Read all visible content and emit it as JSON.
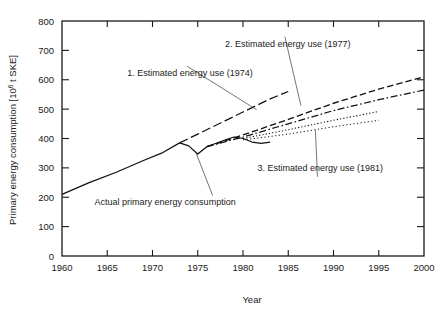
{
  "figure": {
    "kind": "line-chart",
    "background": "#ffffff",
    "ink_color": "#111111"
  },
  "chart_data": {
    "type": "line",
    "title": "",
    "xlabel": "Year",
    "ylabel": "Primary energy consumption [10⁶ t SKE]",
    "ylabel_parts": {
      "pre": "Primary energy consumption [10",
      "sup": "6",
      "post": " t SKE]"
    },
    "xlim": [
      1960,
      2000
    ],
    "ylim": [
      0,
      800
    ],
    "xticks": [
      1960,
      1965,
      1970,
      1975,
      1980,
      1985,
      1990,
      1995,
      2000
    ],
    "xticklabels": [
      "1960",
      "1965",
      "1970",
      "1975",
      "1980",
      "1985",
      "1990",
      "1995",
      "2000"
    ],
    "yticks": [
      0,
      100,
      200,
      300,
      400,
      500,
      600,
      700,
      800
    ],
    "yticklabels": [
      "0",
      "100",
      "200",
      "300",
      "400",
      "500",
      "600",
      "700",
      "800"
    ],
    "grid": false,
    "frame": "box-all-four-sides",
    "ticks_direction": "inward",
    "legend": "none-inline-annotations",
    "series": [
      {
        "name": "Actual primary energy consumption",
        "style": "solid",
        "x": [
          1960,
          1963,
          1966,
          1969,
          1971,
          1973,
          1974,
          1975,
          1976,
          1978,
          1979,
          1980,
          1981,
          1982,
          1983
        ],
        "values": [
          210,
          250,
          285,
          325,
          350,
          385,
          375,
          347,
          372,
          395,
          405,
          400,
          388,
          383,
          388
        ]
      },
      {
        "name": "1. Estimated energy use (1974)",
        "style": "long-dash",
        "x": [
          1973,
          1975,
          1978,
          1980,
          1983,
          1985
        ],
        "values": [
          385,
          415,
          460,
          490,
          535,
          560
        ]
      },
      {
        "name": "2. Estimated energy use (1977)",
        "style": "dashed",
        "x": [
          1976,
          1980,
          1985,
          1990,
          1995,
          2000
        ],
        "values": [
          372,
          412,
          465,
          520,
          568,
          610
        ]
      },
      {
        "name": "2. Estimated energy use (1977) — lower variant",
        "style": "dash-dot",
        "x": [
          1976,
          1980,
          1985,
          1990,
          1995,
          2000
        ],
        "values": [
          372,
          405,
          450,
          495,
          532,
          565
        ]
      },
      {
        "name": "3. Estimated energy use (1981)",
        "style": "dotted-upper",
        "x": [
          1980,
          1985,
          1990,
          1995
        ],
        "values": [
          400,
          430,
          462,
          492
        ]
      },
      {
        "name": "3. Estimated energy use (1981) — lower variant",
        "style": "dotted-lower",
        "x": [
          1980,
          1985,
          1990,
          1995
        ],
        "values": [
          395,
          415,
          440,
          462
        ]
      }
    ],
    "annotations": [
      {
        "id": "anno-1974",
        "text": "1. Estimated energy use (1974)",
        "text_x": 1967.2,
        "text_y": 612,
        "leader_to_x": 1981.5,
        "leader_to_y": 498
      },
      {
        "id": "anno-1977",
        "text": "2. Estimated energy use (1977)",
        "text_x": 1978.0,
        "text_y": 712,
        "leader_to_x": 1986.4,
        "leader_to_y": 512
      },
      {
        "id": "anno-1981",
        "text": "3. Estimated energy use (1981)",
        "text_x": 1981.6,
        "text_y": 290,
        "leader_to_x": 1988.0,
        "leader_to_y": 428
      },
      {
        "id": "anno-actual",
        "text": "Actual primary energy consumption",
        "text_x": 1963.6,
        "text_y": 172,
        "leader_to_x": 1974.8,
        "leader_to_y": 352
      }
    ]
  }
}
